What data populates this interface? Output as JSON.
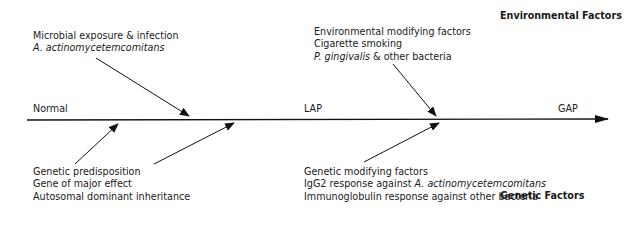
{
  "headings": {
    "environmental": "Environmental Factors",
    "genetic": "Genetic Factors"
  },
  "axis": {
    "labels": {
      "normal": "Normal",
      "lap": "LAP",
      "gap": "GAP"
    }
  },
  "env_factors": [
    {
      "line1": "Microbial exposure & infection",
      "line2_italic": "A. actinomycetemcomitans"
    },
    {
      "line1": "Environmental modifying factors",
      "line2": "Cigarette smoking",
      "line3_italic": "P. gingivalis",
      "line3_rest": " & other bacteria"
    }
  ],
  "genetic_factors": [
    {
      "line1": "Genetic predisposition",
      "line2": "Gene of major effect",
      "line3": "Autosomal dominant inheritance"
    },
    {
      "line1": "Genetic modifying factors",
      "line2_prefix": "IgG2 response against ",
      "line2_italic": "A. actinomycetemcomitans",
      "line3": "Immunoglobulin response against other bacteria"
    }
  ]
}
